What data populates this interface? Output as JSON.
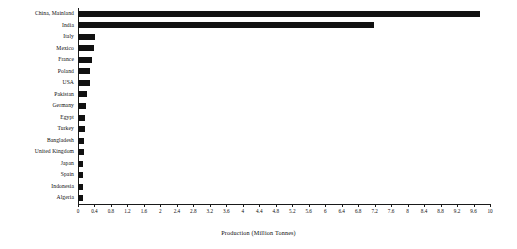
{
  "chart_data": {
    "type": "bar",
    "orientation": "horizontal",
    "title": "",
    "xlabel": "Production (Million Tonnes)",
    "ylabel": "",
    "xlim": [
      0,
      10.0
    ],
    "xticks": [
      "0",
      "0.4",
      "0.8",
      "1.2",
      "1.6",
      "2",
      "2.4",
      "2.8",
      "3.2",
      "3.6",
      "4",
      "4.4",
      "4.8",
      "5.2",
      "5.6",
      "6",
      "6.4",
      "6.8",
      "7.2",
      "7.6",
      "8",
      "8.4",
      "8.8",
      "9.2",
      "9.6",
      "10"
    ],
    "xtick_values": [
      0,
      0.4,
      0.8,
      1.2,
      1.6,
      2,
      2.4,
      2.8,
      3.2,
      3.6,
      4,
      4.4,
      4.8,
      5.2,
      5.6,
      6,
      6.4,
      6.8,
      7.2,
      7.6,
      8,
      8.4,
      8.8,
      9.2,
      9.6,
      10
    ],
    "grid": false,
    "legend": "none",
    "bar_color": "#111111",
    "categories": [
      "China, Mainland",
      "India",
      "Italy",
      "Mexico",
      "France",
      "Poland",
      "USA",
      "Pakistan",
      "Germany",
      "Egypt",
      "Turkey",
      "Bangladesh",
      "United Kingdom",
      "Japan",
      "Spain",
      "Indonesia",
      "Algeria"
    ],
    "values": [
      9.76,
      7.19,
      0.41,
      0.38,
      0.34,
      0.3,
      0.29,
      0.21,
      0.19,
      0.17,
      0.17,
      0.15,
      0.15,
      0.13,
      0.12,
      0.12,
      0.11
    ]
  }
}
